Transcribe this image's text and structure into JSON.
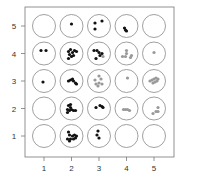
{
  "chart_data": {
    "type": "scatter",
    "title": "",
    "xlabel": "",
    "ylabel": "",
    "x_ticks": [
      "1",
      "2",
      "3",
      "4",
      "5"
    ],
    "y_ticks": [
      "1",
      "2",
      "3",
      "4",
      "5"
    ],
    "xlim": [
      0.5,
      5.5
    ],
    "ylim": [
      0.5,
      5.5
    ],
    "grid": false,
    "legend": null,
    "colors": {
      "dark": "#111111",
      "gray": "#999999",
      "circle": "#888888",
      "frame": "#777777"
    },
    "cells": [
      {
        "col": 1,
        "row": 5,
        "dots": []
      },
      {
        "col": 2,
        "row": 5,
        "dots": [
          {
            "dx": 0,
            "dy": -2,
            "c": "dark"
          }
        ]
      },
      {
        "col": 3,
        "row": 5,
        "dots": [
          {
            "dx": -4,
            "dy": -3,
            "c": "dark"
          },
          {
            "dx": 3,
            "dy": -5,
            "c": "dark"
          },
          {
            "dx": -4,
            "dy": 3,
            "c": "dark"
          }
        ]
      },
      {
        "col": 4,
        "row": 5,
        "dots": [
          {
            "dx": -2,
            "dy": 2,
            "c": "dark"
          },
          {
            "dx": -1,
            "dy": 4,
            "c": "dark"
          },
          {
            "dx": 0,
            "dy": 5,
            "c": "dark"
          }
        ]
      },
      {
        "col": 5,
        "row": 5,
        "dots": []
      },
      {
        "col": 1,
        "row": 4,
        "dots": [
          {
            "dx": -3,
            "dy": -3,
            "c": "dark"
          },
          {
            "dx": 2,
            "dy": -3,
            "c": "dark"
          }
        ]
      },
      {
        "col": 2,
        "row": 4,
        "dots": [
          {
            "dx": -3,
            "dy": -2,
            "c": "dark"
          },
          {
            "dx": -1,
            "dy": -4,
            "c": "dark"
          },
          {
            "dx": 1,
            "dy": -1,
            "c": "dark"
          },
          {
            "dx": 3,
            "dy": -3,
            "c": "dark"
          },
          {
            "dx": -2,
            "dy": 1,
            "c": "dark"
          },
          {
            "dx": 2,
            "dy": 2,
            "c": "dark"
          },
          {
            "dx": 0,
            "dy": 3,
            "c": "dark"
          },
          {
            "dx": -3,
            "dy": 5,
            "c": "dark"
          },
          {
            "dx": 5,
            "dy": -2,
            "c": "dark"
          }
        ]
      },
      {
        "col": 3,
        "row": 4,
        "dots": [
          {
            "dx": -5,
            "dy": -3,
            "c": "dark"
          },
          {
            "dx": -2,
            "dy": -3,
            "c": "dark"
          },
          {
            "dx": 0,
            "dy": -1,
            "c": "dark"
          },
          {
            "dx": 3,
            "dy": 0,
            "c": "dark"
          },
          {
            "dx": 1,
            "dy": 2,
            "c": "dark"
          },
          {
            "dx": -3,
            "dy": 5,
            "c": "dark"
          },
          {
            "dx": 4,
            "dy": 3,
            "c": "gray"
          }
        ]
      },
      {
        "col": 4,
        "row": 4,
        "dots": [
          {
            "dx": 0,
            "dy": -3,
            "c": "gray"
          },
          {
            "dx": 0,
            "dy": 0,
            "c": "gray"
          },
          {
            "dx": -4,
            "dy": 3,
            "c": "gray"
          },
          {
            "dx": -1,
            "dy": 3,
            "c": "gray"
          },
          {
            "dx": 4,
            "dy": 4,
            "c": "gray"
          },
          {
            "dx": 5,
            "dy": 2,
            "c": "gray"
          }
        ]
      },
      {
        "col": 5,
        "row": 4,
        "dots": [
          {
            "dx": 0,
            "dy": -1,
            "c": "gray"
          }
        ]
      },
      {
        "col": 1,
        "row": 3,
        "dots": [
          {
            "dx": -1,
            "dy": 1,
            "c": "dark"
          }
        ]
      },
      {
        "col": 2,
        "row": 3,
        "dots": [
          {
            "dx": -3,
            "dy": 0,
            "c": "dark"
          },
          {
            "dx": -1,
            "dy": -1,
            "c": "dark"
          },
          {
            "dx": 1,
            "dy": -2,
            "c": "dark"
          },
          {
            "dx": 2,
            "dy": 0,
            "c": "dark"
          },
          {
            "dx": 4,
            "dy": 2,
            "c": "dark"
          },
          {
            "dx": 5,
            "dy": 3,
            "c": "dark"
          }
        ]
      },
      {
        "col": 3,
        "row": 3,
        "dots": [
          {
            "dx": 0,
            "dy": -5,
            "c": "gray"
          },
          {
            "dx": -4,
            "dy": -1,
            "c": "gray"
          },
          {
            "dx": 2,
            "dy": -2,
            "c": "gray"
          },
          {
            "dx": -3,
            "dy": 3,
            "c": "gray"
          },
          {
            "dx": 0,
            "dy": 2,
            "c": "gray"
          },
          {
            "dx": 3,
            "dy": 3,
            "c": "gray"
          },
          {
            "dx": -1,
            "dy": 5,
            "c": "gray"
          }
        ]
      },
      {
        "col": 4,
        "row": 3,
        "dots": [
          {
            "dx": 1,
            "dy": -3,
            "c": "gray"
          }
        ]
      },
      {
        "col": 5,
        "row": 3,
        "dots": [
          {
            "dx": -4,
            "dy": 0,
            "c": "gray"
          },
          {
            "dx": -2,
            "dy": -1,
            "c": "gray"
          },
          {
            "dx": 0,
            "dy": -2,
            "c": "gray"
          },
          {
            "dx": 2,
            "dy": -3,
            "c": "gray"
          },
          {
            "dx": 4,
            "dy": -2,
            "c": "gray"
          },
          {
            "dx": 1,
            "dy": 1,
            "c": "gray"
          },
          {
            "dx": -1,
            "dy": 2,
            "c": "gray"
          },
          {
            "dx": 3,
            "dy": 0,
            "c": "gray"
          }
        ]
      },
      {
        "col": 1,
        "row": 2,
        "dots": []
      },
      {
        "col": 2,
        "row": 2,
        "dots": [
          {
            "dx": -3,
            "dy": -3,
            "c": "dark"
          },
          {
            "dx": -1,
            "dy": -1,
            "c": "dark"
          },
          {
            "dx": -4,
            "dy": 1,
            "c": "dark"
          },
          {
            "dx": -2,
            "dy": 2,
            "c": "dark"
          },
          {
            "dx": 0,
            "dy": 1,
            "c": "dark"
          },
          {
            "dx": 2,
            "dy": 2,
            "c": "dark"
          },
          {
            "dx": 4,
            "dy": 2,
            "c": "dark"
          },
          {
            "dx": -4,
            "dy": 4,
            "c": "dark"
          },
          {
            "dx": -1,
            "dy": -4,
            "c": "dark"
          }
        ]
      },
      {
        "col": 3,
        "row": 2,
        "dots": [
          {
            "dx": -3,
            "dy": -1,
            "c": "dark"
          },
          {
            "dx": 1,
            "dy": -3,
            "c": "dark"
          },
          {
            "dx": 3,
            "dy": -2,
            "c": "dark"
          },
          {
            "dx": 4,
            "dy": -1,
            "c": "dark"
          }
        ]
      },
      {
        "col": 4,
        "row": 2,
        "dots": [
          {
            "dx": -3,
            "dy": 1,
            "c": "gray"
          },
          {
            "dx": -1,
            "dy": 1,
            "c": "gray"
          },
          {
            "dx": 1,
            "dy": 1,
            "c": "gray"
          },
          {
            "dx": 3,
            "dy": 2,
            "c": "gray"
          }
        ]
      },
      {
        "col": 5,
        "row": 2,
        "dots": [
          {
            "dx": 4,
            "dy": -1,
            "c": "gray"
          },
          {
            "dx": 2,
            "dy": 3,
            "c": "gray"
          },
          {
            "dx": 4,
            "dy": 3,
            "c": "gray"
          },
          {
            "dx": -1,
            "dy": 5,
            "c": "gray"
          }
        ]
      },
      {
        "col": 1,
        "row": 1,
        "dots": []
      },
      {
        "col": 2,
        "row": 1,
        "dots": [
          {
            "dx": -3,
            "dy": -4,
            "c": "dark"
          },
          {
            "dx": -2,
            "dy": -1,
            "c": "dark"
          },
          {
            "dx": 1,
            "dy": 0,
            "c": "dark"
          },
          {
            "dx": 3,
            "dy": -1,
            "c": "dark"
          },
          {
            "dx": 5,
            "dy": 0,
            "c": "dark"
          },
          {
            "dx": -4,
            "dy": 3,
            "c": "dark"
          },
          {
            "dx": -1,
            "dy": 3,
            "c": "dark"
          },
          {
            "dx": 2,
            "dy": 3,
            "c": "dark"
          },
          {
            "dx": 4,
            "dy": 2,
            "c": "dark"
          },
          {
            "dx": -2,
            "dy": 5,
            "c": "dark"
          }
        ]
      },
      {
        "col": 3,
        "row": 1,
        "dots": [
          {
            "dx": -1,
            "dy": -5,
            "c": "dark"
          },
          {
            "dx": -2,
            "dy": -1,
            "c": "dark"
          },
          {
            "dx": 0,
            "dy": 2,
            "c": "dark"
          }
        ]
      },
      {
        "col": 4,
        "row": 1,
        "dots": []
      },
      {
        "col": 5,
        "row": 1,
        "dots": []
      }
    ]
  }
}
